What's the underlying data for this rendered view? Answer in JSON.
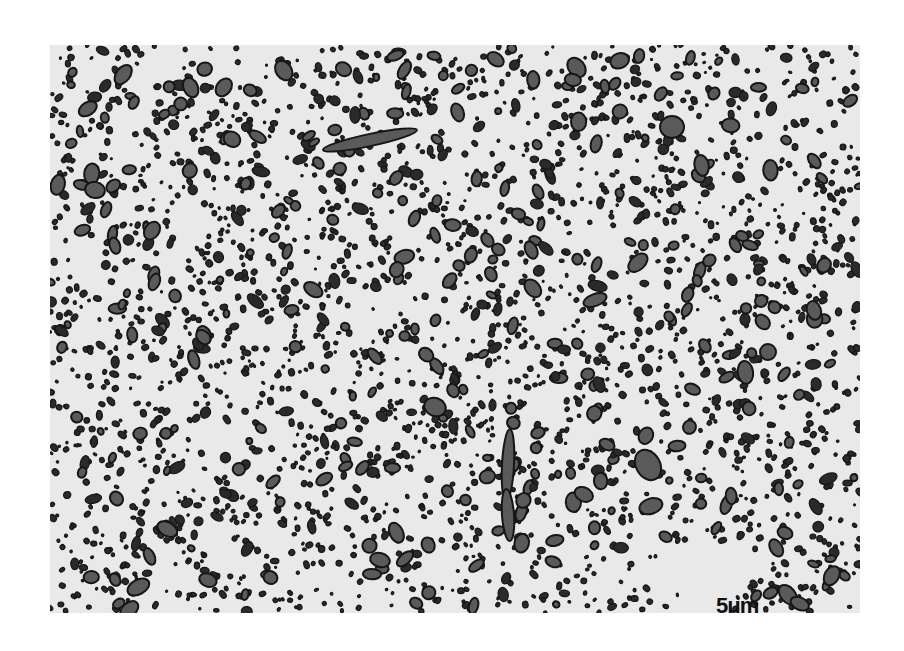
{
  "image": {
    "type": "micrograph",
    "description": "Two-phase microstructure: dark particles dispersed in light matrix",
    "frame": {
      "x": 50,
      "y": 45,
      "width": 810,
      "height": 568
    },
    "colors": {
      "page_background": "#ffffff",
      "matrix": "#e9e9e9",
      "particle_outline": "#161616",
      "particle_fill_large": "#5a5a5a",
      "particle_fill_small": "#2a2a2a"
    }
  },
  "scale_bar": {
    "label": "5μm",
    "length_px": 38
  },
  "particles": {
    "seed": 20240611,
    "small_count": 2300,
    "medium_count": 420,
    "large_count": 110,
    "notable": [
      {
        "cx": 320,
        "cy": 95,
        "rx": 48,
        "ry": 6,
        "rot": -12
      },
      {
        "cx": 622,
        "cy": 82,
        "rx": 12,
        "ry": 11,
        "rot": 0
      },
      {
        "cx": 458,
        "cy": 420,
        "rx": 6,
        "ry": 36,
        "rot": 3
      },
      {
        "cx": 458,
        "cy": 470,
        "rx": 6,
        "ry": 26,
        "rot": -4
      },
      {
        "cx": 598,
        "cy": 420,
        "rx": 12,
        "ry": 16,
        "rot": -30
      },
      {
        "cx": 385,
        "cy": 362,
        "rx": 11,
        "ry": 9,
        "rot": 20
      },
      {
        "cx": 718,
        "cy": 307,
        "rx": 8,
        "ry": 8,
        "rot": 0
      },
      {
        "cx": 45,
        "cy": 145,
        "rx": 10,
        "ry": 8,
        "rot": 10
      },
      {
        "cx": 545,
        "cy": 255,
        "rx": 12,
        "ry": 6,
        "rot": -20
      },
      {
        "cx": 330,
        "cy": 515,
        "rx": 10,
        "ry": 7,
        "rot": 15
      }
    ]
  }
}
